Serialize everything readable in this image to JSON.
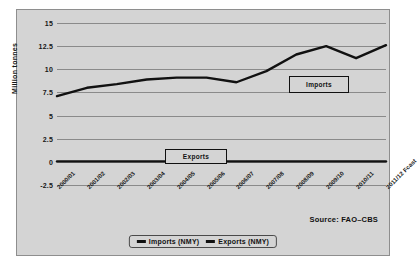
{
  "chart_data": {
    "type": "line",
    "title": "",
    "xlabel": "",
    "ylabel": "Million tonnes",
    "ylim": [
      -2.5,
      15
    ],
    "yticks": [
      "15",
      "12.5",
      "10",
      "7.5",
      "5",
      "2.5",
      "0",
      "-2.5"
    ],
    "ytick_values": [
      15,
      12.5,
      10,
      7.5,
      5,
      2.5,
      0,
      -2.5
    ],
    "grid": true,
    "legend_position": "bottom",
    "categories": [
      "2000/01",
      "2001/02",
      "2002/03",
      "2003/04",
      "2004/05",
      "2005/06",
      "2006/07",
      "2007/08",
      "2008/09",
      "2009/10",
      "2010/11",
      "2011/12 Fcast"
    ],
    "series": [
      {
        "name": "Imports (NMY)",
        "color": "#111111",
        "values": [
          7.1,
          8.0,
          8.4,
          8.9,
          9.1,
          9.1,
          8.6,
          9.8,
          11.6,
          12.5,
          11.2,
          12.6
        ]
      },
      {
        "name": "Exports (NMY)",
        "color": "#111111",
        "values": [
          0.05,
          0.05,
          0.05,
          0.05,
          0.05,
          0.05,
          0.05,
          0.05,
          0.05,
          0.05,
          0.05,
          0.05
        ]
      }
    ],
    "annotations": [
      {
        "text": "Imports",
        "target": "imports-series"
      },
      {
        "text": "Exports",
        "target": "exports-series"
      }
    ],
    "source": "Source: FAO–CBS"
  },
  "legend": {
    "items": [
      {
        "label": "Imports (NMY)"
      },
      {
        "label": "Exports (NMY)"
      }
    ]
  }
}
